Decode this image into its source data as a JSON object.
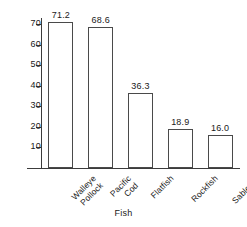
{
  "chart_data": {
    "type": "bar",
    "title": "",
    "xlabel": "Fish",
    "ylabel": "",
    "categories": [
      "Walleye Pollock",
      "Pacific Cod",
      "Flatfish",
      "Rockfish",
      "Sablefish"
    ],
    "category_lines": [
      [
        "Walleye",
        "Pollock"
      ],
      [
        "Pacific",
        "Cod"
      ],
      [
        "Flatfish"
      ],
      [
        "Rockfish"
      ],
      [
        "Sablefish"
      ]
    ],
    "values": [
      71.2,
      68.6,
      36.3,
      18.9,
      16.0
    ],
    "value_labels": [
      "71.2",
      "68.6",
      "36.3",
      "18.9",
      "16.0"
    ],
    "ylim": [
      0,
      73
    ],
    "yticks": [
      10,
      20,
      30,
      40,
      50,
      60,
      70
    ],
    "ytick_labels": [
      "10",
      "20",
      "30",
      "40",
      "50",
      "60",
      "70"
    ],
    "grid": false,
    "legend": null,
    "bar_style": {
      "fill": "#ffffff",
      "edge": "#4a4a4a"
    },
    "axis_color": "#3c3c3c",
    "label_rotation": -45
  }
}
